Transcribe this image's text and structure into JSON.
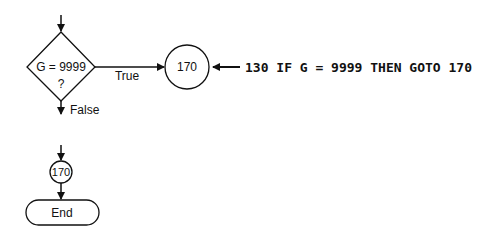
{
  "diagram": {
    "decision": {
      "line1": "G  =  9999",
      "line2": "?"
    },
    "true_label": "True",
    "false_label": "False",
    "connector_top": {
      "label": "170"
    },
    "code_annotation": "130 IF G = 9999 THEN GOTO 170",
    "connector_bottom": {
      "label": "170"
    },
    "terminator": {
      "label": "End"
    },
    "colors": {
      "stroke": "#111111",
      "background": "#ffffff"
    }
  }
}
